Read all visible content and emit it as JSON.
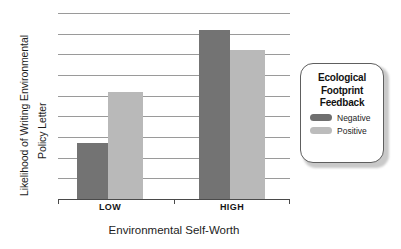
{
  "chart_data": {
    "type": "bar",
    "title": "",
    "xlabel": "Environmental Self-Worth",
    "ylabel": "Likelihood of Writing Environmental Policy Letter",
    "ylabel_lines": [
      "Likelihood of Writing Environmental",
      "Policy Letter"
    ],
    "categories": [
      "LOW",
      "HIGH"
    ],
    "series": [
      {
        "name": "Negative",
        "color": "#737373",
        "values": [
          2.7,
          8.2
        ]
      },
      {
        "name": "Positive",
        "color": "#b9b9b9",
        "values": [
          5.2,
          7.2
        ]
      }
    ],
    "ylim": [
      0,
      9.2
    ],
    "yticks": [],
    "gridlines": [
      1,
      2,
      3,
      4,
      5,
      6,
      7,
      8,
      9
    ],
    "grid": true,
    "grid_axis": "y",
    "legend": {
      "position": "right",
      "title": "Ecological Footprint Feedback",
      "title_lines": [
        "Ecological",
        "Footprint",
        "Feedback"
      ],
      "entries": [
        {
          "label": "Negative",
          "color": "#737373"
        },
        {
          "label": "Positive",
          "color": "#b9b9b9"
        }
      ]
    }
  },
  "axes": {
    "x_tick_labels": [
      "LOW",
      "HIGH"
    ],
    "x_title": "Environmental Self-Worth",
    "y_title_line_0": "Likelihood of Writing Environmental",
    "y_title_line_1": "Policy Letter"
  },
  "legend": {
    "title_line_0": "Ecological",
    "title_line_1": "Footprint",
    "title_line_2": "Feedback",
    "entry_0_label": "Negative",
    "entry_1_label": "Positive"
  },
  "bars": {
    "low_negative": "2.7",
    "low_positive": "5.2",
    "high_negative": "8.2",
    "high_positive": "7.2"
  }
}
